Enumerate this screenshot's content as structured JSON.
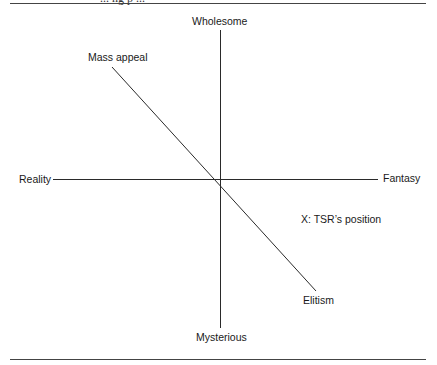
{
  "header": {
    "cut_off_text": "... ng    p ..."
  },
  "diagram": {
    "type": "perceptual-map",
    "axes": {
      "vertical": {
        "top_label": "Wholesome",
        "bottom_label": "Mysterious"
      },
      "horizontal": {
        "left_label": "Reality",
        "right_label": "Fantasy"
      },
      "diagonal": {
        "start_label": "Mass appeal",
        "end_label": "Elitism"
      }
    },
    "annotation": "X: TSR’s position",
    "colors": {
      "line": "#2a2a2a",
      "rule": "#444444",
      "text": "#1a1a1a",
      "background": "#ffffff"
    }
  }
}
